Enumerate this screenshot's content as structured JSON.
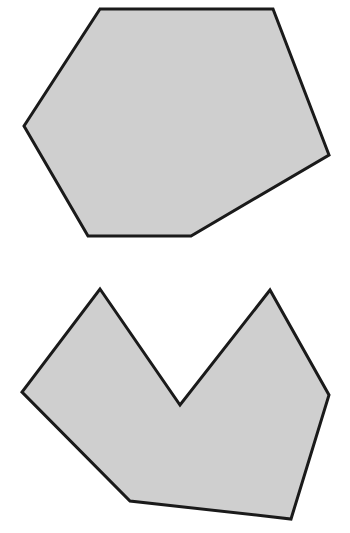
{
  "diagram": {
    "shapes": [
      {
        "id": "convex-hexagon",
        "type": "convex polygon",
        "sides": 6,
        "points": [
          [
            100,
            9
          ],
          [
            273,
            9
          ],
          [
            329,
            155
          ],
          [
            191,
            236
          ],
          [
            88,
            236
          ],
          [
            24,
            126
          ]
        ]
      },
      {
        "id": "concave-heptagon",
        "type": "concave polygon",
        "sides": 7,
        "points": [
          [
            100,
            289
          ],
          [
            180,
            405
          ],
          [
            270,
            290
          ],
          [
            329,
            395
          ],
          [
            291,
            519
          ],
          [
            130,
            501
          ],
          [
            22,
            392
          ]
        ]
      }
    ],
    "colors": {
      "fill": "#cfcfcf",
      "stroke": "#1a1a1a",
      "background": "#ffffff"
    }
  }
}
